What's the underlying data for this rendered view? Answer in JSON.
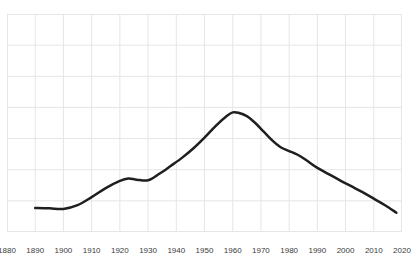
{
  "chart_data": {
    "type": "line",
    "title": "",
    "subtitle": "",
    "xlabel": "",
    "ylabel": "",
    "xlim": [
      1880,
      2020
    ],
    "ylim": [
      0,
      7
    ],
    "grid": true,
    "legend": null,
    "legend_position": "none",
    "x_tick_labels": [
      "1880",
      "1890",
      "1900",
      "1910",
      "1920",
      "1930",
      "1940",
      "1950",
      "1960",
      "1970",
      "1980",
      "1990",
      "2000",
      "2010",
      "2020"
    ],
    "x_ticks": [
      1880,
      1890,
      1900,
      1910,
      1920,
      1930,
      1940,
      1950,
      1960,
      1970,
      1980,
      1990,
      2000,
      2010,
      2020
    ],
    "y_ticks": [
      0,
      1,
      2,
      3,
      4,
      5,
      6,
      7
    ],
    "y_tick_labels": [],
    "series": [
      {
        "name": "series-1",
        "color": "#1f1f1f",
        "width": 2.5,
        "x": [
          1890,
          1895,
          1900,
          1905,
          1910,
          1915,
          1920,
          1923,
          1926,
          1930,
          1934,
          1938,
          1942,
          1946,
          1950,
          1954,
          1958,
          1960,
          1962,
          1965,
          1968,
          1971,
          1974,
          1977,
          1980,
          1983,
          1986,
          1990,
          1994,
          1998,
          2002,
          2006,
          2010,
          2014,
          2018
        ],
        "y": [
          0.77,
          0.76,
          0.74,
          0.86,
          1.12,
          1.41,
          1.64,
          1.72,
          1.68,
          1.66,
          1.87,
          2.12,
          2.38,
          2.68,
          3.03,
          3.41,
          3.73,
          3.84,
          3.83,
          3.72,
          3.5,
          3.22,
          2.94,
          2.72,
          2.6,
          2.48,
          2.31,
          2.06,
          1.86,
          1.66,
          1.47,
          1.28,
          1.07,
          0.86,
          0.62
        ]
      }
    ]
  },
  "grid_style": {
    "line_color": "#e6e6e6",
    "background": "#ffffff",
    "border_color": "#e2e2e2"
  },
  "axis": {
    "label_color": "#3b3b3b",
    "label_size_px": 8
  }
}
